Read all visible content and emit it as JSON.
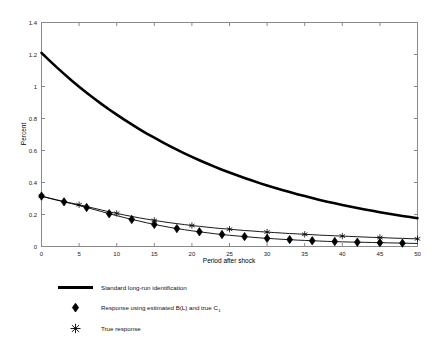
{
  "chart_data": {
    "type": "line",
    "title": "",
    "xlabel": "Period after shock",
    "ylabel": "Percent",
    "xlim": [
      0,
      50
    ],
    "ylim": [
      0,
      1.4
    ],
    "xticks": [
      0,
      5,
      10,
      15,
      20,
      25,
      30,
      35,
      40,
      45,
      50
    ],
    "yticks": [
      0,
      0.2,
      0.4,
      0.6,
      0.8,
      1,
      1.2,
      1.4
    ],
    "xticklabels": [
      "0",
      "5",
      "10",
      "15",
      "20",
      "25",
      "30",
      "35",
      "40",
      "45",
      "50"
    ],
    "yticklabels": [
      "0",
      "0.2",
      "0.4",
      "0.6",
      "0.8",
      "1",
      "1.2",
      "1.4"
    ],
    "grid": false,
    "legend_position": "below-axes",
    "series": [
      {
        "name": "Standard long-run identification",
        "marker": "none",
        "linewidth": "thick",
        "color": "#000000",
        "x": [
          0,
          1,
          2,
          3,
          4,
          5,
          6,
          7,
          8,
          9,
          10,
          11,
          12,
          13,
          14,
          15,
          16,
          17,
          18,
          19,
          20,
          21,
          22,
          23,
          24,
          25,
          26,
          27,
          28,
          29,
          30,
          31,
          32,
          33,
          34,
          35,
          36,
          37,
          38,
          39,
          40,
          41,
          42,
          43,
          44,
          45,
          46,
          47,
          48,
          49,
          50
        ],
        "y": [
          1.21,
          1.165,
          1.121,
          1.079,
          1.038,
          0.999,
          0.961,
          0.925,
          0.89,
          0.856,
          0.824,
          0.793,
          0.763,
          0.734,
          0.706,
          0.68,
          0.654,
          0.629,
          0.605,
          0.582,
          0.56,
          0.539,
          0.519,
          0.499,
          0.48,
          0.462,
          0.445,
          0.428,
          0.412,
          0.396,
          0.381,
          0.367,
          0.353,
          0.34,
          0.327,
          0.315,
          0.303,
          0.291,
          0.28,
          0.27,
          0.26,
          0.25,
          0.24,
          0.231,
          0.223,
          0.214,
          0.206,
          0.198,
          0.191,
          0.184,
          0.177
        ]
      },
      {
        "name": "Response using estimated B(L) and true C",
        "name_subscript": "1",
        "marker": "diamond",
        "linewidth": "thin",
        "color": "#000000",
        "x": [
          0,
          1,
          2,
          3,
          4,
          5,
          6,
          7,
          8,
          9,
          10,
          11,
          12,
          13,
          14,
          15,
          16,
          17,
          18,
          19,
          20,
          21,
          22,
          23,
          24,
          25,
          26,
          27,
          28,
          29,
          30,
          31,
          32,
          33,
          34,
          35,
          36,
          37,
          38,
          39,
          40,
          41,
          42,
          43,
          44,
          45,
          46,
          47,
          48,
          49,
          50
        ],
        "y": [
          0.315,
          0.302,
          0.29,
          0.279,
          0.268,
          0.256,
          0.244,
          0.231,
          0.218,
          0.205,
          0.193,
          0.181,
          0.169,
          0.159,
          0.148,
          0.138,
          0.129,
          0.12,
          0.112,
          0.105,
          0.098,
          0.092,
          0.086,
          0.08,
          0.075,
          0.07,
          0.066,
          0.062,
          0.058,
          0.054,
          0.051,
          0.048,
          0.045,
          0.043,
          0.04,
          0.038,
          0.036,
          0.034,
          0.032,
          0.031,
          0.029,
          0.028,
          0.027,
          0.026,
          0.025,
          0.024,
          0.023,
          0.022,
          0.021,
          0.02,
          0.019
        ],
        "marker_x": [
          0,
          3,
          6,
          9,
          12,
          15,
          18,
          21,
          24,
          27,
          30,
          33,
          36,
          39,
          42,
          45,
          48
        ],
        "marker_y": [
          0.315,
          0.279,
          0.244,
          0.205,
          0.169,
          0.138,
          0.112,
          0.092,
          0.075,
          0.062,
          0.051,
          0.043,
          0.036,
          0.031,
          0.027,
          0.024,
          0.021
        ]
      },
      {
        "name": "True response",
        "marker": "star",
        "linewidth": "thin",
        "color": "#000000",
        "x": [
          0,
          1,
          2,
          3,
          4,
          5,
          6,
          7,
          8,
          9,
          10,
          11,
          12,
          13,
          14,
          15,
          16,
          17,
          18,
          19,
          20,
          21,
          22,
          23,
          24,
          25,
          26,
          27,
          28,
          29,
          30,
          31,
          32,
          33,
          34,
          35,
          36,
          37,
          38,
          39,
          40,
          41,
          42,
          43,
          44,
          45,
          46,
          47,
          48,
          49,
          50
        ],
        "y": [
          0.315,
          0.303,
          0.292,
          0.281,
          0.271,
          0.261,
          0.25,
          0.239,
          0.228,
          0.217,
          0.207,
          0.197,
          0.188,
          0.179,
          0.171,
          0.163,
          0.156,
          0.149,
          0.143,
          0.137,
          0.131,
          0.126,
          0.121,
          0.116,
          0.112,
          0.108,
          0.104,
          0.1,
          0.097,
          0.093,
          0.09,
          0.087,
          0.084,
          0.081,
          0.079,
          0.076,
          0.074,
          0.071,
          0.069,
          0.067,
          0.065,
          0.063,
          0.061,
          0.059,
          0.057,
          0.056,
          0.054,
          0.052,
          0.051,
          0.049,
          0.048
        ],
        "marker_x": [
          0,
          5,
          10,
          15,
          20,
          25,
          30,
          35,
          40,
          45,
          50
        ],
        "marker_y": [
          0.315,
          0.261,
          0.207,
          0.163,
          0.131,
          0.108,
          0.09,
          0.076,
          0.065,
          0.056,
          0.048
        ]
      }
    ]
  },
  "legend": {
    "entries": [
      {
        "label": "Standard long-run identification",
        "marker": "line",
        "sub": ""
      },
      {
        "label": "Response using estimated B(L) and true C",
        "marker": "diamond",
        "sub": "1"
      },
      {
        "label": "True response",
        "marker": "star",
        "sub": ""
      }
    ]
  }
}
